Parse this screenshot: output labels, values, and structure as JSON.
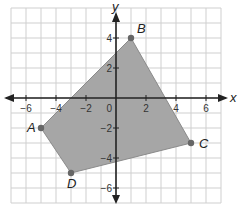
{
  "chart_data": {
    "type": "polygon",
    "title": "",
    "xlabel": "x",
    "ylabel": "y",
    "xlim": [
      -7,
      7
    ],
    "ylim": [
      -7,
      6
    ],
    "grid": true,
    "x_ticks": [
      -6,
      -4,
      -2,
      2,
      4,
      6
    ],
    "y_ticks": [
      4,
      2,
      -2,
      -4,
      -6
    ],
    "origin_label": "0",
    "points": [
      {
        "name": "A",
        "x": -5,
        "y": -2
      },
      {
        "name": "B",
        "x": 1,
        "y": 4
      },
      {
        "name": "C",
        "x": 5,
        "y": -3
      },
      {
        "name": "D",
        "x": -3,
        "y": -5
      }
    ],
    "polygon_order": [
      "A",
      "B",
      "C",
      "D"
    ],
    "fill_color": "#a6a6a6",
    "point_color": "#666666",
    "grid_color": "#cfcfcf",
    "axis_color": "#222222"
  }
}
